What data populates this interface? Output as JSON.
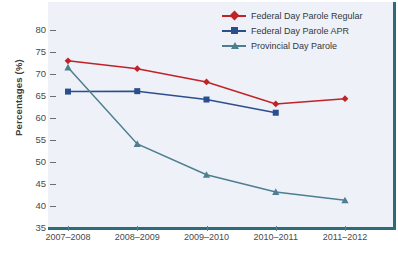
{
  "chart_data": {
    "type": "line",
    "title": "",
    "xlabel": "",
    "ylabel": "Percentages (%)",
    "categories": [
      "2007–2008",
      "2008–2009",
      "2009–2010",
      "2010–2011",
      "2011–2012"
    ],
    "ylim": [
      35,
      80
    ],
    "yticks": [
      35,
      40,
      45,
      50,
      55,
      60,
      65,
      70,
      75,
      80
    ],
    "grid": false,
    "legend_position": "top-right",
    "series": [
      {
        "name": "Federal Day Parole Regular",
        "color": "#c02227",
        "marker": "diamond",
        "values": [
          73.0,
          71.2,
          68.2,
          63.2,
          64.4
        ]
      },
      {
        "name": "Federal Day Parole APR",
        "color": "#2b4f8e",
        "marker": "square",
        "values": [
          66.0,
          66.1,
          64.2,
          61.2,
          null
        ]
      },
      {
        "name": "Provincial Day Parole",
        "color": "#4d7f90",
        "marker": "triangle",
        "values": [
          71.5,
          54.1,
          47.1,
          43.2,
          41.3
        ]
      }
    ]
  },
  "axis": {
    "y_label": "Percentages (%)",
    "y_tick_labels": [
      "80",
      "75",
      "70",
      "65",
      "60",
      "55",
      "50",
      "45",
      "40",
      "35"
    ],
    "x_tick_labels": [
      "2007–2008",
      "2008–2009",
      "2009–2010",
      "2010–2011",
      "2011–2012"
    ]
  },
  "legend": {
    "entries": [
      {
        "label": "Federal Day Parole Regular",
        "color": "#c02227",
        "marker": "diamond-icon"
      },
      {
        "label": "Federal Day Parole APR",
        "color": "#2b4f8e",
        "marker": "square-icon"
      },
      {
        "label": "Provincial Day Parole",
        "color": "#4d7f90",
        "marker": "triangle-icon"
      }
    ]
  },
  "colors": {
    "plot_background": "#eef1f7",
    "frame": "#2c6b78",
    "page_background": "#ffffff"
  }
}
